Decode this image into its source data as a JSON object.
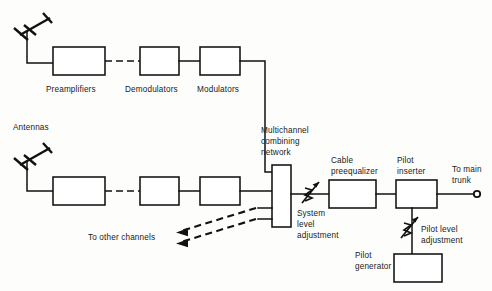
{
  "diagram": {
    "background_color": "#fdfdfb",
    "line_color": "#111111",
    "labels": {
      "preamplifiers": "Preamplifiers",
      "demodulators": "Demodulators",
      "modulators": "Modulators",
      "antennas": "Antennas",
      "multichannel_line1": "Multichannel",
      "multichannel_line2": "combining",
      "multichannel_line3": "network",
      "system_level_line1": "System",
      "system_level_line2": "level",
      "system_level_line3": "adjustment",
      "cable_preequalizer_line1": "Cable",
      "cable_preequalizer_line2": "preequalizer",
      "pilot_inserter_line1": "Pilot",
      "pilot_inserter_line2": "inserter",
      "to_main_trunk_line1": "To main",
      "to_main_trunk_line2": "trunk",
      "pilot_level_line1": "Pilot level",
      "pilot_level_line2": "adjustment",
      "pilot_generator_line1": "Pilot",
      "pilot_generator_line2": "generator",
      "to_other_channels": "To other channels"
    },
    "nodes": [
      {
        "id": "antenna-top",
        "type": "antenna",
        "label": ""
      },
      {
        "id": "antenna-bottom",
        "type": "antenna",
        "label": "Antennas"
      },
      {
        "id": "preamplifier-top",
        "type": "box",
        "label": "Preamplifiers"
      },
      {
        "id": "demodulator-top",
        "type": "box",
        "label": "Demodulators"
      },
      {
        "id": "modulator-top",
        "type": "box",
        "label": "Modulators"
      },
      {
        "id": "preamplifier-bottom",
        "type": "box",
        "label": "Preamplifiers"
      },
      {
        "id": "demodulator-bottom",
        "type": "box",
        "label": "Demodulators"
      },
      {
        "id": "modulator-bottom",
        "type": "box",
        "label": "Modulators"
      },
      {
        "id": "multichannel-combining-network",
        "type": "box",
        "label": "Multichannel combining network"
      },
      {
        "id": "system-level-adjustment",
        "type": "variable-attenuator",
        "label": "System level adjustment"
      },
      {
        "id": "cable-preequalizer",
        "type": "box",
        "label": "Cable preequalizer"
      },
      {
        "id": "pilot-inserter",
        "type": "box",
        "label": "Pilot inserter"
      },
      {
        "id": "pilot-level-adjustment",
        "type": "variable-attenuator",
        "label": "Pilot level adjustment"
      },
      {
        "id": "pilot-generator",
        "type": "box",
        "label": "Pilot generator"
      },
      {
        "id": "main-trunk-terminal",
        "type": "terminal",
        "label": "To main trunk"
      }
    ]
  }
}
